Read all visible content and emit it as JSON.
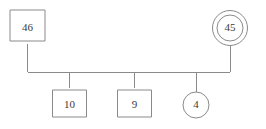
{
  "diagram": {
    "type": "pedigree",
    "canvas": {
      "width": 266,
      "height": 129
    },
    "style": {
      "stroke_color": "#8a8a8a",
      "fill_color": "#ffffff",
      "text_color": "#3a3a3a",
      "background": "#ffffff",
      "stroke_width": 1
    }
  },
  "generations": [
    {
      "name": "parents",
      "members": [
        {
          "id": "parent-male",
          "label": "46",
          "shape": "square",
          "sex": "male",
          "marker": "none",
          "x": 27.5,
          "y": 28,
          "size": 35
        },
        {
          "id": "parent-female",
          "label": "45",
          "shape": "double-circle",
          "sex": "female",
          "marker": "double-ring",
          "x": 230,
          "y": 28,
          "outer_radius": 17.5,
          "inner_radius": 13
        }
      ]
    },
    {
      "name": "children",
      "members": [
        {
          "id": "child-1",
          "label": "10",
          "shape": "square",
          "sex": "male",
          "marker": "none",
          "x": 69.5,
          "y": 105,
          "size": 34
        },
        {
          "id": "child-2",
          "label": "9",
          "shape": "square",
          "sex": "male",
          "marker": "none",
          "x": 134.5,
          "y": 105,
          "size": 34
        },
        {
          "id": "child-3",
          "label": "4",
          "shape": "circle",
          "sex": "female",
          "marker": "none",
          "x": 196,
          "y": 105,
          "radius": 13
        }
      ]
    }
  ],
  "connectors": {
    "sibship_line_y": 72,
    "parent_male_drop": {
      "x": 27.5,
      "from_y": 43.5,
      "to_y": 72
    },
    "parent_female_drop": {
      "x": 230,
      "from_y": 45.5,
      "to_y": 72
    },
    "sibship_line": {
      "x1": 27.5,
      "x2": 230,
      "y": 72
    },
    "child_drops": [
      {
        "x": 69.5,
        "from_y": 72,
        "to_y": 88
      },
      {
        "x": 134.5,
        "from_y": 72,
        "to_y": 88
      },
      {
        "x": 196,
        "from_y": 72,
        "to_y": 92
      }
    ]
  }
}
